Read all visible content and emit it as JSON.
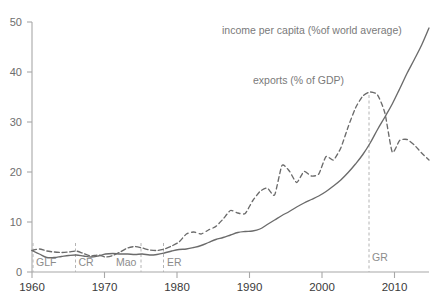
{
  "chart_data": {
    "type": "line",
    "title": "",
    "subtitle": "",
    "xlabel": "",
    "ylabel": "",
    "xlim": [
      1960,
      2014
    ],
    "ylim": [
      0,
      50
    ],
    "grid": false,
    "legend_position": "inline-annotations",
    "xticks": [
      "1960",
      "1970",
      "1980",
      "1990",
      "2000",
      "2010"
    ],
    "xtick_values": [
      1960,
      1970,
      1980,
      1990,
      2000,
      2010
    ],
    "yticks": [
      "0",
      "10",
      "20",
      "30",
      "40",
      "50"
    ],
    "ytick_values": [
      0,
      10,
      20,
      30,
      40,
      50
    ],
    "series": [
      {
        "name": "income per capita (%of world average)",
        "style": "solid",
        "color": "#6b6b6b",
        "x": [
          1960,
          1961,
          1962,
          1963,
          1964,
          1965,
          1966,
          1967,
          1968,
          1969,
          1970,
          1971,
          1972,
          1973,
          1974,
          1975,
          1976,
          1977,
          1978,
          1979,
          1980,
          1981,
          1982,
          1983,
          1984,
          1985,
          1986,
          1987,
          1988,
          1989,
          1990,
          1991,
          1992,
          1993,
          1994,
          1995,
          1996,
          1997,
          1998,
          1999,
          2000,
          2001,
          2002,
          2003,
          2004,
          2005,
          2006,
          2007,
          2008,
          2009,
          2010,
          2011,
          2012,
          2013,
          2014
        ],
        "values": [
          4.3,
          3.6,
          2.9,
          2.9,
          3.1,
          3.3,
          3.4,
          3.2,
          3.0,
          3.2,
          3.6,
          3.7,
          3.6,
          3.6,
          3.5,
          3.6,
          3.4,
          3.5,
          3.8,
          4.2,
          4.5,
          4.6,
          4.9,
          5.3,
          5.9,
          6.5,
          6.9,
          7.4,
          7.9,
          8.1,
          8.2,
          8.6,
          9.5,
          10.4,
          11.3,
          12.1,
          13.0,
          13.8,
          14.5,
          15.2,
          16.1,
          17.2,
          18.4,
          19.9,
          21.6,
          23.5,
          25.8,
          28.5,
          31.0,
          33.6,
          36.6,
          39.7,
          42.5,
          45.4,
          48.8
        ]
      },
      {
        "name": "exports (% of GDP)",
        "style": "dashed",
        "color": "#6b6b6b",
        "x": [
          1960,
          1961,
          1962,
          1963,
          1964,
          1965,
          1966,
          1967,
          1968,
          1969,
          1970,
          1971,
          1972,
          1973,
          1974,
          1975,
          1976,
          1977,
          1978,
          1979,
          1980,
          1981,
          1982,
          1983,
          1984,
          1985,
          1986,
          1987,
          1988,
          1989,
          1990,
          1991,
          1992,
          1993,
          1994,
          1995,
          1996,
          1997,
          1998,
          1999,
          2000,
          2001,
          2002,
          2003,
          2004,
          2005,
          2006,
          2007,
          2008,
          2009,
          2010,
          2011,
          2012,
          2013,
          2014
        ],
        "values": [
          4.3,
          4.6,
          4.2,
          4.0,
          3.9,
          4.0,
          4.2,
          3.7,
          3.2,
          3.4,
          3.0,
          3.3,
          4.0,
          4.8,
          5.1,
          4.8,
          4.4,
          4.3,
          4.6,
          5.2,
          6.0,
          7.6,
          8.0,
          7.6,
          8.4,
          9.1,
          10.6,
          12.3,
          11.8,
          11.7,
          14.2,
          16.1,
          16.8,
          15.4,
          21.3,
          20.2,
          17.9,
          20.1,
          19.2,
          19.6,
          23.1,
          22.4,
          24.8,
          29.0,
          32.8,
          35.2,
          36.0,
          35.4,
          31.8,
          24.0,
          26.3,
          26.5,
          25.4,
          23.8,
          22.4
        ]
      }
    ],
    "annotations": [
      {
        "name": "GLF",
        "label": "GLF",
        "x": 1960,
        "type": "vertical-marker"
      },
      {
        "name": "CR",
        "label": "CR",
        "x": 1966,
        "type": "vertical-marker"
      },
      {
        "name": "Mao",
        "label": "Mao",
        "x": 1976,
        "type": "vertical-marker"
      },
      {
        "name": "ER",
        "label": "ER",
        "x": 1979,
        "type": "vertical-marker"
      },
      {
        "name": "GR",
        "label": "GR",
        "x": 2007,
        "type": "vertical-marker"
      }
    ],
    "series_labels": [
      {
        "text": "income per capita (%of world average)",
        "x": 1987,
        "y": 45.5
      },
      {
        "text": "exports (% of GDP)",
        "x": 1995,
        "y": 38.5
      }
    ]
  },
  "axis": {
    "y_label_0": "0",
    "y_label_10": "10",
    "y_label_20": "20",
    "y_label_30": "30",
    "y_label_40": "40",
    "y_label_50": "50",
    "x_label_1960": "1960",
    "x_label_1970": "1970",
    "x_label_1980": "1980",
    "x_label_1990": "1990",
    "x_label_2000": "2000",
    "x_label_2010": "2010"
  },
  "events": {
    "glf": "GLF",
    "cr": "CR",
    "mao": "Mao",
    "er": "ER",
    "gr": "GR"
  },
  "labels": {
    "income": "income per capita (%of world average)",
    "exports": "exports (% of GDP)"
  },
  "colors": {
    "line": "#6b6b6b",
    "axis": "#a8a8a8",
    "tick_text": "#6e6e6e",
    "xtick_text": "#3a3a3a",
    "event_text": "#8c8c8c",
    "series_text": "#7a7a7a",
    "background": "#ffffff"
  }
}
